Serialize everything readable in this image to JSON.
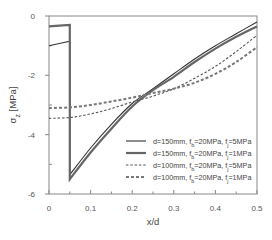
{
  "chart_data": {
    "type": "line",
    "title": "",
    "xlabel": "x/d",
    "ylabel": "σz [MPa]",
    "ylabel_main": "σ",
    "ylabel_sub": "z",
    "ylabel_unit": " [MPa]",
    "xlim": [
      0,
      0.5
    ],
    "ylim": [
      -6,
      0
    ],
    "x_ticks": [
      0,
      0.1,
      0.2,
      0.3,
      0.4,
      0.5
    ],
    "x_tick_labels": [
      "0",
      "0.1",
      "0.2",
      "0.3",
      "0.4",
      "0.5"
    ],
    "x_minor_ticks": [
      0.05,
      0.15,
      0.25,
      0.35,
      0.45
    ],
    "y_ticks": [
      0,
      -2,
      -4,
      -6
    ],
    "y_tick_labels": [
      "0",
      "-2",
      "-4",
      "-6"
    ],
    "grid": false,
    "legend_position": "lower right",
    "series": [
      {
        "name": "d=150mm, fb=20MPa, fj=5MPa",
        "legend": {
          "pre": "d=150mm, f",
          "sub1": "b",
          "mid": "=20MPa, f",
          "sub2": "j",
          "post": "=5MPa"
        },
        "style": "thin-solid",
        "x": [
          0,
          0.05,
          0.05,
          0.1,
          0.15,
          0.2,
          0.25,
          0.3,
          0.35,
          0.4,
          0.45,
          0.5
        ],
        "y": [
          -1.0,
          -0.85,
          -5.35,
          -4.45,
          -3.65,
          -2.95,
          -2.45,
          -1.95,
          -1.45,
          -1.0,
          -0.6,
          -0.2
        ]
      },
      {
        "name": "d=150mm, fb=20MPa, fj=1MPa",
        "legend": {
          "pre": "d=150mm, f",
          "sub1": "b",
          "mid": "=20MPa, f",
          "sub2": "j",
          "post": "=1MPa"
        },
        "style": "thick-solid",
        "x": [
          0,
          0.05,
          0.05,
          0.1,
          0.15,
          0.2,
          0.25,
          0.3,
          0.35,
          0.4,
          0.45,
          0.5
        ],
        "y": [
          -0.35,
          -0.3,
          -5.5,
          -4.6,
          -3.8,
          -3.05,
          -2.5,
          -2.05,
          -1.55,
          -1.1,
          -0.7,
          -0.35
        ]
      },
      {
        "name": "d=100mm, fb=20MPa, fj=5MPa",
        "legend": {
          "pre": "d=100mm, f",
          "sub1": "b",
          "mid": "=20MPa, f",
          "sub2": "j",
          "post": "=5MPa"
        },
        "style": "thin-dashed",
        "x": [
          0,
          0.05,
          0.1,
          0.15,
          0.2,
          0.25,
          0.3,
          0.35,
          0.4,
          0.45,
          0.5
        ],
        "y": [
          -3.45,
          -3.42,
          -3.3,
          -3.12,
          -2.9,
          -2.7,
          -2.45,
          -2.1,
          -1.7,
          -1.2,
          -0.65
        ]
      },
      {
        "name": "d=100mm, fb=20MPa, fj=1MPa",
        "legend": {
          "pre": "d=100mm, f",
          "sub1": "b",
          "mid": "=20MPa, f",
          "sub2": "j",
          "post": "=1MPa"
        },
        "style": "thick-dashed",
        "x": [
          0,
          0.05,
          0.1,
          0.15,
          0.2,
          0.25,
          0.3,
          0.35,
          0.4,
          0.45,
          0.5
        ],
        "y": [
          -3.1,
          -3.08,
          -3.0,
          -2.88,
          -2.75,
          -2.6,
          -2.45,
          -2.25,
          -1.95,
          -1.55,
          -1.05
        ]
      }
    ]
  },
  "colors": {
    "axis": "#888888",
    "line": "#444444",
    "text": "#555555"
  }
}
